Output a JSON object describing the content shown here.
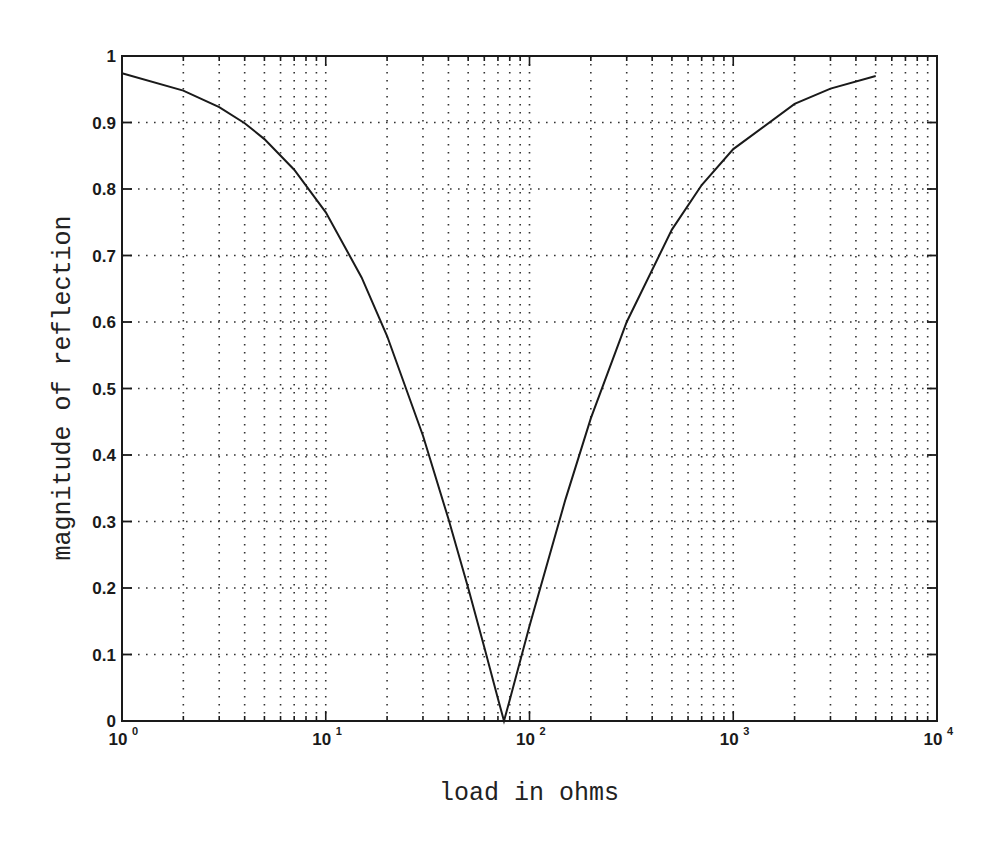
{
  "chart_data": {
    "type": "line",
    "title": "",
    "xlabel": "load in ohms",
    "ylabel": "magnitude of reflection",
    "xscale": "log",
    "xlim": [
      1,
      10000
    ],
    "ylim": [
      0,
      1
    ],
    "grid": true,
    "grid_style": "dotted",
    "legend": null,
    "x_ticks": [
      {
        "base": "10",
        "exp": "0",
        "value": 1
      },
      {
        "base": "10",
        "exp": "1",
        "value": 10
      },
      {
        "base": "10",
        "exp": "2",
        "value": 100
      },
      {
        "base": "10",
        "exp": "3",
        "value": 1000
      },
      {
        "base": "10",
        "exp": "4",
        "value": 10000
      }
    ],
    "y_ticks": [
      "0",
      "0.1",
      "0.2",
      "0.3",
      "0.4",
      "0.5",
      "0.6",
      "0.7",
      "0.8",
      "0.9",
      "1"
    ],
    "series": [
      {
        "name": "reflection magnitude",
        "color": "#1a1a1a",
        "x": [
          1,
          2,
          3,
          4,
          5,
          7,
          10,
          15,
          20,
          30,
          40,
          50,
          60,
          70,
          75,
          80,
          100,
          150,
          200,
          300,
          500,
          700,
          1000,
          2000,
          3000,
          5000
        ],
        "y": [
          0.974,
          0.948,
          0.923,
          0.899,
          0.875,
          0.829,
          0.765,
          0.667,
          0.579,
          0.429,
          0.304,
          0.2,
          0.111,
          0.034,
          0.0,
          0.032,
          0.143,
          0.333,
          0.455,
          0.6,
          0.739,
          0.806,
          0.86,
          0.928,
          0.951,
          0.97
        ]
      }
    ]
  }
}
